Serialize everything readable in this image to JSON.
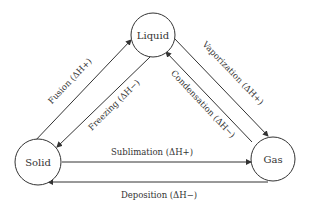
{
  "diagram": {
    "type": "phase-transition-cycle",
    "nodes": {
      "liquid": {
        "label": "Liquid"
      },
      "solid": {
        "label": "Solid"
      },
      "gas": {
        "label": "Gas"
      }
    },
    "edges": {
      "fusion": {
        "label": "Fusion (ΔH+)",
        "from": "Solid",
        "to": "Liquid"
      },
      "freezing": {
        "label": "Freezing (ΔH−)",
        "from": "Liquid",
        "to": "Solid"
      },
      "vaporization": {
        "label": "Vaporization (ΔH+)",
        "from": "Liquid",
        "to": "Gas"
      },
      "condensation": {
        "label": "Condensation (ΔH−)",
        "from": "Gas",
        "to": "Liquid"
      },
      "sublimation": {
        "label": "Sublimation (ΔH+)",
        "from": "Solid",
        "to": "Gas"
      },
      "deposition": {
        "label": "Deposition (ΔH−)",
        "from": "Gas",
        "to": "Solid"
      }
    },
    "colors": {
      "stroke": "#333333",
      "background": "#ffffff"
    }
  }
}
